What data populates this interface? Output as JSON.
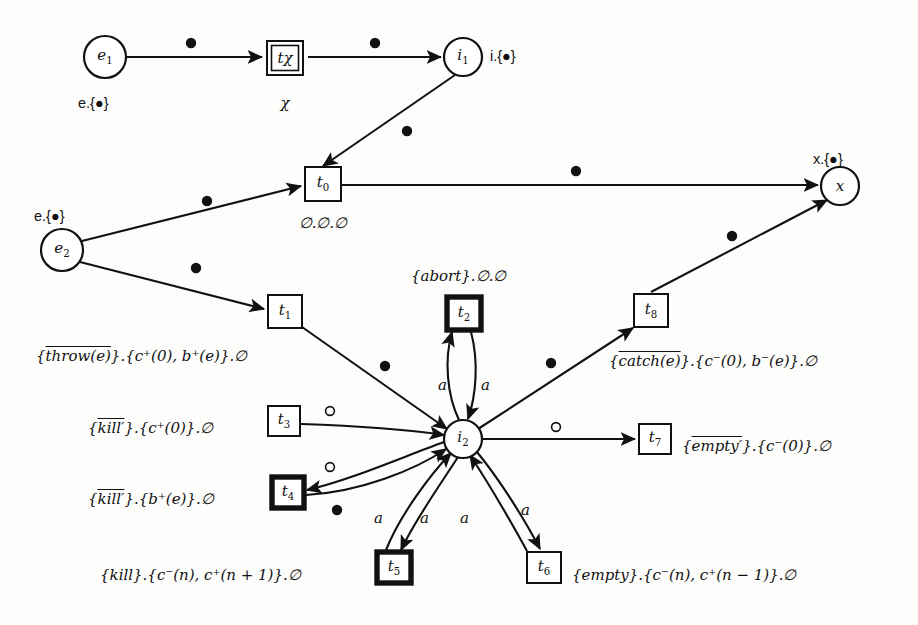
{
  "diagram": {
    "background": "#fdfdfc",
    "ink": "#111111"
  },
  "places": [
    {
      "id": "e1",
      "label": "e₁",
      "cx": 105,
      "cy": 57,
      "r": 21,
      "annotation": "e.{●}",
      "ann_x": 78,
      "ann_y": 96
    },
    {
      "id": "i1",
      "label": "i₁",
      "cx": 463,
      "cy": 57,
      "r": 19,
      "annotation": "i.{●}",
      "ann_x": 490,
      "ann_y": 49
    },
    {
      "id": "e2",
      "label": "e₂",
      "cx": 62,
      "cy": 250,
      "r": 21,
      "annotation": "e.{●}",
      "ann_x": 34,
      "ann_y": 209
    },
    {
      "id": "x",
      "label": "x",
      "cx": 840,
      "cy": 186,
      "r": 19,
      "annotation": "x.{●}",
      "ann_x": 813,
      "ann_y": 152
    },
    {
      "id": "i2",
      "label": "i₂",
      "cx": 463,
      "cy": 439,
      "r": 19,
      "annotation": "",
      "ann_x": 0,
      "ann_y": 0
    }
  ],
  "transitions": [
    {
      "id": "tx",
      "label": "tχ",
      "x": 267,
      "y": 41,
      "w": 36,
      "h": 34,
      "style": "double",
      "sub_label": "χ",
      "sub_x": 285,
      "sub_y": 96,
      "side_label": "",
      "side_x": 0,
      "side_y": 0,
      "side_align": "left"
    },
    {
      "id": "t0",
      "label": "t₀",
      "x": 305,
      "y": 167,
      "w": 36,
      "h": 34,
      "style": "single",
      "sub_label": "∅.∅.∅",
      "sub_x": 323,
      "sub_y": 216,
      "side_label": "",
      "side_x": 0,
      "side_y": 0,
      "side_align": "left"
    },
    {
      "id": "t1",
      "label": "t₁",
      "x": 268,
      "y": 295,
      "w": 34,
      "h": 33,
      "style": "single",
      "sub_label": "",
      "sub_x": 0,
      "sub_y": 0,
      "side_label": "{throw(e)}.{c⁺(0), b⁺(e)}.∅",
      "side_x": 36,
      "side_y": 349,
      "side_align": "left"
    },
    {
      "id": "t2",
      "label": "t₂",
      "x": 447,
      "y": 297,
      "w": 34,
      "h": 33,
      "style": "bold",
      "sub_label": "",
      "sub_x": 0,
      "sub_y": 0,
      "side_label": "{abort}.∅.∅",
      "side_x": 411,
      "side_y": 269,
      "side_align": "left"
    },
    {
      "id": "t3",
      "label": "t₃",
      "x": 268,
      "y": 406,
      "w": 32,
      "h": 30,
      "style": "single",
      "sub_label": "",
      "sub_x": 0,
      "sub_y": 0,
      "side_label": "{kill′}.{c⁺(0)}.∅",
      "side_x": 88,
      "side_y": 421,
      "side_align": "left"
    },
    {
      "id": "t4",
      "label": "t₄",
      "x": 272,
      "y": 477,
      "w": 32,
      "h": 31,
      "style": "bold",
      "sub_label": "",
      "sub_x": 0,
      "sub_y": 0,
      "side_label": "{kill′}.{b⁺(e)}.∅",
      "side_x": 88,
      "side_y": 492,
      "side_align": "left"
    },
    {
      "id": "t5",
      "label": "t₅",
      "x": 377,
      "y": 552,
      "w": 34,
      "h": 31,
      "style": "bold",
      "sub_label": "",
      "sub_x": 0,
      "sub_y": 0,
      "side_label": "{kill}.{c⁻(n), c⁺(n + 1)}.∅",
      "side_x": 100,
      "side_y": 568,
      "side_align": "left"
    },
    {
      "id": "t6",
      "label": "t₆",
      "x": 527,
      "y": 552,
      "w": 34,
      "h": 31,
      "style": "single",
      "sub_label": "",
      "sub_x": 0,
      "sub_y": 0,
      "side_label": "{empty}.{c⁻(n), c⁺(n − 1)}.∅",
      "side_x": 572,
      "side_y": 568,
      "side_align": "left"
    },
    {
      "id": "t7",
      "label": "t₇",
      "x": 639,
      "y": 424,
      "w": 32,
      "h": 30,
      "style": "single",
      "sub_label": "",
      "sub_x": 0,
      "sub_y": 0,
      "side_label": "{empty′}.{c⁻(0)}.∅",
      "side_x": 682,
      "side_y": 439,
      "side_align": "left"
    },
    {
      "id": "t8",
      "label": "t₈",
      "x": 634,
      "y": 294,
      "w": 34,
      "h": 33,
      "style": "single",
      "sub_label": "",
      "sub_x": 0,
      "sub_y": 0,
      "side_label": "{catch(e)}.{c⁻(0), b⁻(e)}.∅",
      "side_x": 609,
      "side_y": 354,
      "side_align": "left"
    }
  ],
  "overlined_labels": [
    {
      "transition": "t1",
      "text": "throw(e)"
    },
    {
      "transition": "t3",
      "text": "kill′"
    },
    {
      "transition": "t4",
      "text": "kill′"
    },
    {
      "transition": "t7",
      "text": "empty′"
    },
    {
      "transition": "t8",
      "text": "catch(e)"
    }
  ],
  "arcs": [
    {
      "id": "e1-tx",
      "from": "e1",
      "to": "tx",
      "d": "M 126 57 L 262 57",
      "marker": "filled-dot",
      "mx": 191,
      "my": 43,
      "label": "",
      "lx": 0,
      "ly": 0
    },
    {
      "id": "tx-i1",
      "from": "tx",
      "to": "i1",
      "d": "M 308 57 L 441 57",
      "marker": "filled-dot",
      "mx": 375,
      "my": 43,
      "label": "",
      "lx": 0,
      "ly": 0
    },
    {
      "id": "i1-t0",
      "from": "i1",
      "to": "t0",
      "d": "M 455 75 L 323 166",
      "marker": "filled-dot",
      "mx": 407,
      "my": 131,
      "label": "",
      "lx": 0,
      "ly": 0
    },
    {
      "id": "e2-t0",
      "from": "e2",
      "to": "t0",
      "d": "M 82 241 L 301 186",
      "marker": "filled-dot",
      "mx": 207,
      "my": 201,
      "label": "",
      "lx": 0,
      "ly": 0
    },
    {
      "id": "t0-x",
      "from": "t0",
      "to": "x",
      "d": "M 341 185 L 818 185",
      "marker": "filled-dot",
      "mx": 576,
      "my": 171,
      "label": "",
      "lx": 0,
      "ly": 0
    },
    {
      "id": "e2-t1",
      "from": "e2",
      "to": "t1",
      "d": "M 80 262 L 264 309",
      "marker": "filled-dot",
      "mx": 196,
      "my": 268,
      "label": "",
      "lx": 0,
      "ly": 0
    },
    {
      "id": "t1-i2",
      "from": "t1",
      "to": "i2",
      "d": "M 302 327 L 447 429",
      "marker": "filled-dot",
      "mx": 385,
      "my": 366,
      "label": "",
      "lx": 0,
      "ly": 0
    },
    {
      "id": "t8-x",
      "from": "t8",
      "to": "x",
      "d": "M 651 292 L 827 200",
      "marker": "filled-dot",
      "mx": 732,
      "my": 236,
      "label": "",
      "lx": 0,
      "ly": 0
    },
    {
      "id": "i2-t8",
      "from": "i2",
      "to": "t8",
      "d": "M 478 429 L 633 328",
      "marker": "filled-dot",
      "mx": 551,
      "my": 363,
      "label": "",
      "lx": 0,
      "ly": 0
    },
    {
      "id": "i2-t2",
      "from": "i2",
      "to": "t2",
      "d": "M 459 420 C 447 395, 444 360, 452 332",
      "marker": "none",
      "mx": 0,
      "my": 0,
      "label": "a",
      "lx": 438,
      "ly": 378
    },
    {
      "id": "t2-i2",
      "from": "t2",
      "to": "i2",
      "d": "M 471 332 C 479 362, 476 396, 468 419",
      "marker": "none",
      "mx": 0,
      "my": 0,
      "label": "a",
      "lx": 481,
      "ly": 378
    },
    {
      "id": "t3-i2",
      "from": "t3",
      "to": "i2",
      "d": "M 301 424 C 360 426, 410 430, 444 435",
      "marker": "hollow-dot",
      "mx": 330,
      "my": 411,
      "label": "",
      "lx": 0,
      "ly": 0
    },
    {
      "id": "t4-i2",
      "from": "i2",
      "to": "t4",
      "d": "M 444 442 C 400 458, 350 480, 307 490",
      "marker": "hollow-dot",
      "mx": 330,
      "my": 467,
      "label": "",
      "lx": 0,
      "ly": 0
    },
    {
      "id": "t4b-i2",
      "from": "t4",
      "to": "i2",
      "d": "M 306 495 C 360 492, 415 470, 446 449",
      "marker": "filled-dot",
      "mx": 337,
      "my": 510,
      "label": "",
      "lx": 0,
      "ly": 0
    },
    {
      "id": "i2-t7",
      "from": "i2",
      "to": "t7",
      "d": "M 482 439 L 635 439",
      "marker": "hollow-dot",
      "mx": 556,
      "my": 427,
      "label": "",
      "lx": 0,
      "ly": 0
    },
    {
      "id": "t5-i2",
      "from": "t5",
      "to": "i2",
      "d": "M 386 550 C 400 515, 430 475, 451 453",
      "marker": "none",
      "mx": 0,
      "my": 0,
      "label": "a",
      "lx": 374,
      "ly": 511
    },
    {
      "id": "i2-t5",
      "from": "i2",
      "to": "t5",
      "d": "M 458 457 C 440 485, 415 520, 401 550",
      "marker": "none",
      "mx": 0,
      "my": 0,
      "label": "a",
      "lx": 420,
      "ly": 511
    },
    {
      "id": "t6-i2",
      "from": "t6",
      "to": "i2",
      "d": "M 527 551 C 510 520, 485 478, 470 455",
      "marker": "none",
      "mx": 0,
      "my": 0,
      "label": "a",
      "lx": 460,
      "ly": 511
    },
    {
      "id": "i2-t6",
      "from": "i2",
      "to": "t6",
      "d": "M 477 452 C 500 480, 525 520, 540 549",
      "marker": "none",
      "mx": 0,
      "my": 0,
      "label": "a",
      "lx": 521,
      "ly": 503
    }
  ],
  "markers": {
    "filled_dot": "●",
    "hollow_dot": "○"
  }
}
